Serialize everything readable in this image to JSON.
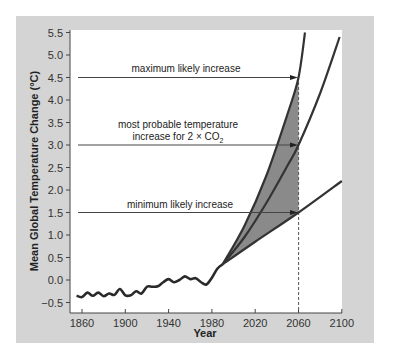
{
  "chart_data": {
    "type": "line",
    "title": "",
    "xlabel": "Year",
    "ylabel": "Mean Global Temperature Change (°C)",
    "xlim": [
      1850,
      2100
    ],
    "ylim": [
      -0.7,
      5.5
    ],
    "x_ticks": [
      "1860",
      "1900",
      "1940",
      "1980",
      "2020",
      "2060",
      "2100"
    ],
    "y_ticks": [
      "5.5",
      "5.0",
      "4.5",
      "4.0",
      "3.5",
      "3.0",
      "2.5",
      "2.0",
      "1.5",
      "1.0",
      "0.5",
      "0.0",
      "-0.5"
    ],
    "grid": false,
    "series": [
      {
        "name": "observed",
        "x": [
          1855,
          1860,
          1865,
          1870,
          1875,
          1880,
          1885,
          1890,
          1895,
          1900,
          1905,
          1910,
          1915,
          1920,
          1925,
          1930,
          1935,
          1940,
          1945,
          1950,
          1955,
          1960,
          1965,
          1970,
          1975,
          1980,
          1985,
          1990
        ],
        "values": [
          -0.35,
          -0.38,
          -0.28,
          -0.35,
          -0.28,
          -0.36,
          -0.3,
          -0.33,
          -0.2,
          -0.34,
          -0.34,
          -0.25,
          -0.3,
          -0.15,
          -0.15,
          -0.14,
          -0.05,
          0.02,
          -0.05,
          0.0,
          0.08,
          0.02,
          0.04,
          -0.05,
          -0.1,
          0.05,
          0.25,
          0.35
        ]
      },
      {
        "name": "maximum likely increase",
        "x": [
          1990,
          2010,
          2030,
          2050,
          2060,
          2066
        ],
        "values": [
          0.35,
          1.2,
          2.3,
          3.7,
          4.5,
          5.5
        ]
      },
      {
        "name": "most probable increase",
        "x": [
          1990,
          2010,
          2030,
          2050,
          2060,
          2080,
          2098
        ],
        "values": [
          0.35,
          0.95,
          1.7,
          2.55,
          3.0,
          4.15,
          5.4
        ]
      },
      {
        "name": "minimum likely increase",
        "x": [
          1990,
          2020,
          2060,
          2100
        ],
        "values": [
          0.35,
          0.85,
          1.5,
          2.2
        ]
      }
    ],
    "annotations": [
      {
        "text": "maximum likely increase",
        "y": 4.5,
        "x": 2060
      },
      {
        "text": "most probable temperature increase for 2 × CO2",
        "y": 3.0,
        "x": 2060
      },
      {
        "text": "minimum likely increase",
        "y": 1.5,
        "x": 2060
      },
      {
        "text": "dashed line at 2060",
        "x": 2060
      }
    ],
    "shaded_region": {
      "between": [
        "maximum likely increase",
        "minimum likely increase"
      ],
      "x_range": [
        1990,
        2060
      ],
      "color": "#8a8a8a"
    }
  },
  "labels": {
    "max": "maximum likely increase",
    "prob1": "most probable temperature",
    "prob2": "increase for 2 × CO",
    "prob_sub": "2",
    "min": "minimum likely increase",
    "xlabel": "Year",
    "ylabel": "Mean Global Temperature Change (°C)"
  },
  "colors": {
    "frame": "#d4d4d4",
    "plot": "#ffffff",
    "line": "#333333",
    "shade": "#8a8a8a"
  }
}
